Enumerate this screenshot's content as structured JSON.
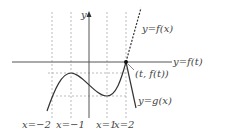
{
  "diagram": {
    "axes": {
      "y_axis_label": "y"
    },
    "curve_labels": {
      "f_of_x": "y=f(x)",
      "f_of_t": "y=f(t)",
      "g_of_x": "y=g(x)",
      "point": "(t, f(t))"
    },
    "vertical_line_labels": [
      "x=−2",
      "x=−1",
      "x=1",
      "x=2"
    ],
    "colors": {
      "curve": "#333333",
      "axis": "#555555",
      "guide": "#aaaaaa",
      "text": "#444444"
    }
  }
}
